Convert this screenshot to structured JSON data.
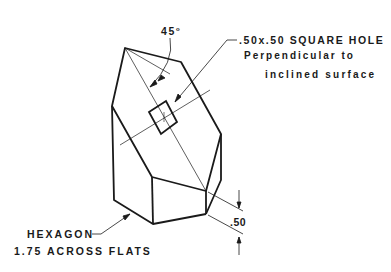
{
  "annotations": {
    "angle": "45",
    "angle_unit": "o",
    "hole_line1": ".50x.50 SQUARE HOLE",
    "hole_line2": "Perpendicular to",
    "hole_line3": "inclined surface",
    "hexagon_line1": "HEXAGON",
    "hexagon_line2": "1.75 ACROSS FLATS",
    "dimension": ".50"
  },
  "colors": {
    "line": "#1a1a1a",
    "background": "#ffffff"
  }
}
